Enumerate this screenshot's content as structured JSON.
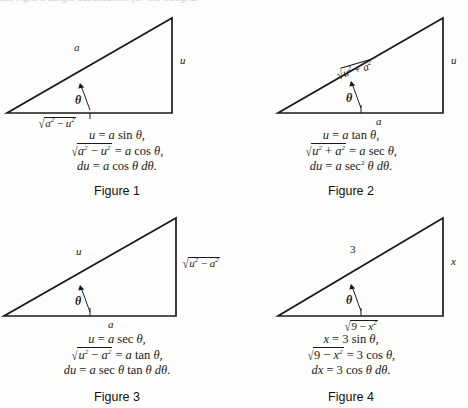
{
  "document": {
    "title": "Trigonometric Substitution Triangles",
    "top_bleed_text": "the right triangle   substitution   for the integral"
  },
  "figures": [
    {
      "id": "figure-1",
      "caption": "Figure 1",
      "substitution": "sine",
      "sides": {
        "hypotenuse": "a",
        "vertical": "u",
        "base_radicand": "a² − u²",
        "base_label": "√(a² − u²)"
      },
      "angle_label": "θ",
      "formulas": [
        "u = a sin θ,",
        "√(a² − u²) = a cos θ,",
        "du = a cos θ dθ."
      ]
    },
    {
      "id": "figure-2",
      "caption": "Figure 2",
      "substitution": "tangent",
      "sides": {
        "hypotenuse": "√(u² + a²)",
        "vertical": "u",
        "base_label": "a"
      },
      "angle_label": "θ",
      "formulas": [
        "u = a tan θ,",
        "√(u² + a²) = a sec θ,",
        "du = a sec² θ dθ."
      ]
    },
    {
      "id": "figure-3",
      "caption": "Figure 3",
      "substitution": "secant",
      "sides": {
        "hypotenuse": "u",
        "vertical": "√(u² − a²)",
        "base_label": "a"
      },
      "angle_label": "θ",
      "formulas": [
        "u = a sec θ,",
        "√(u² − a²) = a tan θ,",
        "du = a sec θ tan θ dθ."
      ]
    },
    {
      "id": "figure-4",
      "caption": "Figure 4",
      "substitution": "sine (numeric example, a = 3)",
      "sides": {
        "hypotenuse": "3",
        "vertical": "x",
        "base_label": "√(9 − x²)"
      },
      "angle_label": "θ",
      "formulas": [
        "x = 3 sin θ,",
        "√(9 − x²) = 3 cos θ,",
        "dx = 3 cos θ dθ."
      ]
    }
  ],
  "colors": {
    "ink": "#1a1a1a",
    "paper": "#fdfdfb",
    "bleed": "#c9c9c9"
  }
}
